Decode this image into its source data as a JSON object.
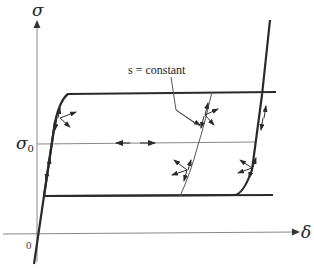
{
  "diagram": {
    "type": "stress-displacement hysteresis loop",
    "axes": {
      "y_label": "σ",
      "x_label": "δ",
      "origin_label": "0"
    },
    "reference_line": {
      "label_main": "σ",
      "label_sub": "0"
    },
    "annotation": {
      "text": "s = constant"
    },
    "colors": {
      "curve": "#2a2a2a",
      "axis": "#777777",
      "thin": "#555555",
      "background": "#ffffff"
    }
  }
}
